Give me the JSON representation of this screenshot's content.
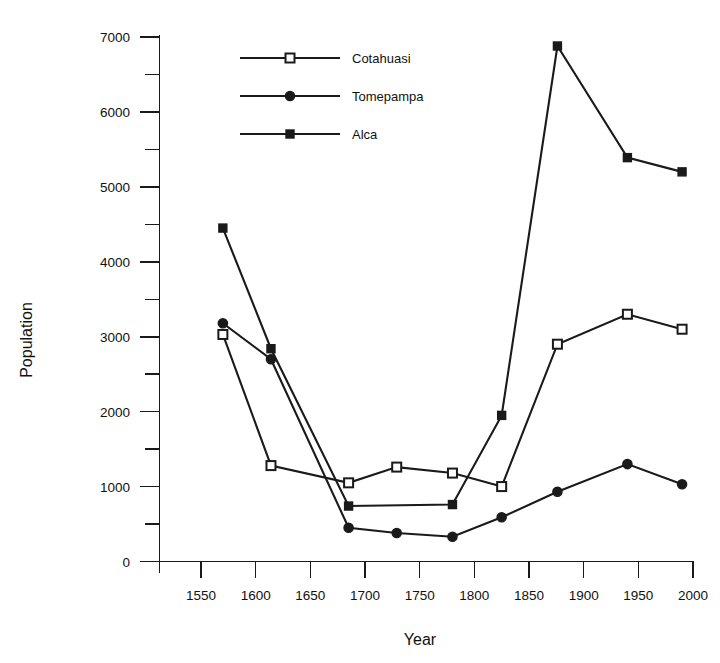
{
  "chart_data": {
    "type": "line",
    "title": "",
    "xlabel": "Year",
    "ylabel": "Population",
    "xlim": [
      1500,
      2000
    ],
    "ylim": [
      0,
      7000
    ],
    "grid": false,
    "legend_position": "top-center",
    "x_ticks": [
      1550,
      1600,
      1650,
      1700,
      1750,
      1800,
      1850,
      1900,
      1950,
      2000
    ],
    "x_tick_labels": [
      "1550",
      "1600",
      "1650",
      "1700",
      "1750",
      "1800",
      "1850",
      "1900",
      "1950",
      "2000"
    ],
    "y_ticks": [
      0,
      1000,
      2000,
      3000,
      4000,
      5000,
      6000,
      7000
    ],
    "y_tick_labels": [
      "0",
      "1000",
      "2000",
      "3000",
      "4000",
      "5000",
      "6000",
      "7000"
    ],
    "y_minor_ticks": [
      500,
      1500,
      2500,
      3500,
      4500,
      5500,
      6500
    ],
    "series": [
      {
        "name": "Cotahuasi",
        "marker": "open-square",
        "x": [
          1570,
          1614,
          1685,
          1729,
          1780,
          1825,
          1876,
          1940,
          1990
        ],
        "values": [
          3030,
          1280,
          1050,
          1260,
          1180,
          1000,
          2900,
          3300,
          3100
        ]
      },
      {
        "name": "Tomepampa",
        "marker": "filled-circle",
        "x": [
          1570,
          1614,
          1685,
          1729,
          1780,
          1825,
          1876,
          1940,
          1990
        ],
        "values": [
          3180,
          2700,
          450,
          380,
          330,
          590,
          930,
          1300,
          1030
        ]
      },
      {
        "name": "Alca",
        "marker": "filled-square",
        "x": [
          1570,
          1614,
          1685,
          1780,
          1825,
          1876,
          1940,
          1990
        ],
        "values": [
          4450,
          2840,
          740,
          760,
          1950,
          6880,
          5390,
          5200
        ]
      }
    ]
  },
  "legend": {
    "entries": [
      {
        "label": "Cotahuasi",
        "marker": "open-square"
      },
      {
        "label": "Tomepampa",
        "marker": "filled-circle"
      },
      {
        "label": "Alca",
        "marker": "filled-square"
      }
    ]
  },
  "colors": {
    "ink": "#1a1a1a",
    "background": "#ffffff",
    "marker_fill_open": "#ffffff"
  }
}
